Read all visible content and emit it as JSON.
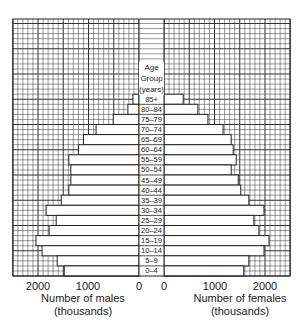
{
  "chart_data": {
    "type": "bar",
    "subtype": "population-pyramid",
    "title": "",
    "center_header": [
      "Age",
      "Group",
      "(years)"
    ],
    "categories": [
      "85+",
      "80–84",
      "75–79",
      "70–74",
      "65–69",
      "60–64",
      "55–59",
      "50–54",
      "45–49",
      "40–44",
      "35–39",
      "30–34",
      "25–29",
      "20–24",
      "15–19",
      "10–14",
      "5–9",
      "0–4"
    ],
    "series": [
      {
        "name": "Males",
        "side": "left",
        "values": [
          120,
          220,
          510,
          850,
          1100,
          1200,
          1390,
          1350,
          1350,
          1390,
          1540,
          1840,
          1640,
          1780,
          2040,
          1920,
          1620,
          1480
        ]
      },
      {
        "name": "Females",
        "side": "right",
        "values": [
          380,
          670,
          870,
          1170,
          1330,
          1370,
          1430,
          1330,
          1470,
          1520,
          1680,
          1980,
          1780,
          1880,
          2080,
          1980,
          1680,
          1580
        ]
      }
    ],
    "left_axis": {
      "ticks": [
        2000,
        1000,
        0
      ],
      "label": "Number of males",
      "unit": "(thousands)",
      "range": [
        0,
        2500
      ]
    },
    "right_axis": {
      "ticks": [
        0,
        1000,
        2000
      ],
      "label": "Number of females",
      "unit": "(thousands)",
      "range": [
        0,
        2500
      ]
    },
    "grid": {
      "minor": 100,
      "major": 500,
      "visible": true
    }
  },
  "labels": {
    "age_header_1": "Age",
    "age_header_2": "Group",
    "age_header_3": "(years)",
    "male_label": "Number of males",
    "male_unit": "(thousands)",
    "female_label": "Number of females",
    "female_unit": "(thousands)",
    "tick_l2000": "2000",
    "tick_l1000": "1000",
    "tick_l0": "0",
    "tick_r0": "0",
    "tick_r1000": "1000",
    "tick_r2000": "2000"
  }
}
